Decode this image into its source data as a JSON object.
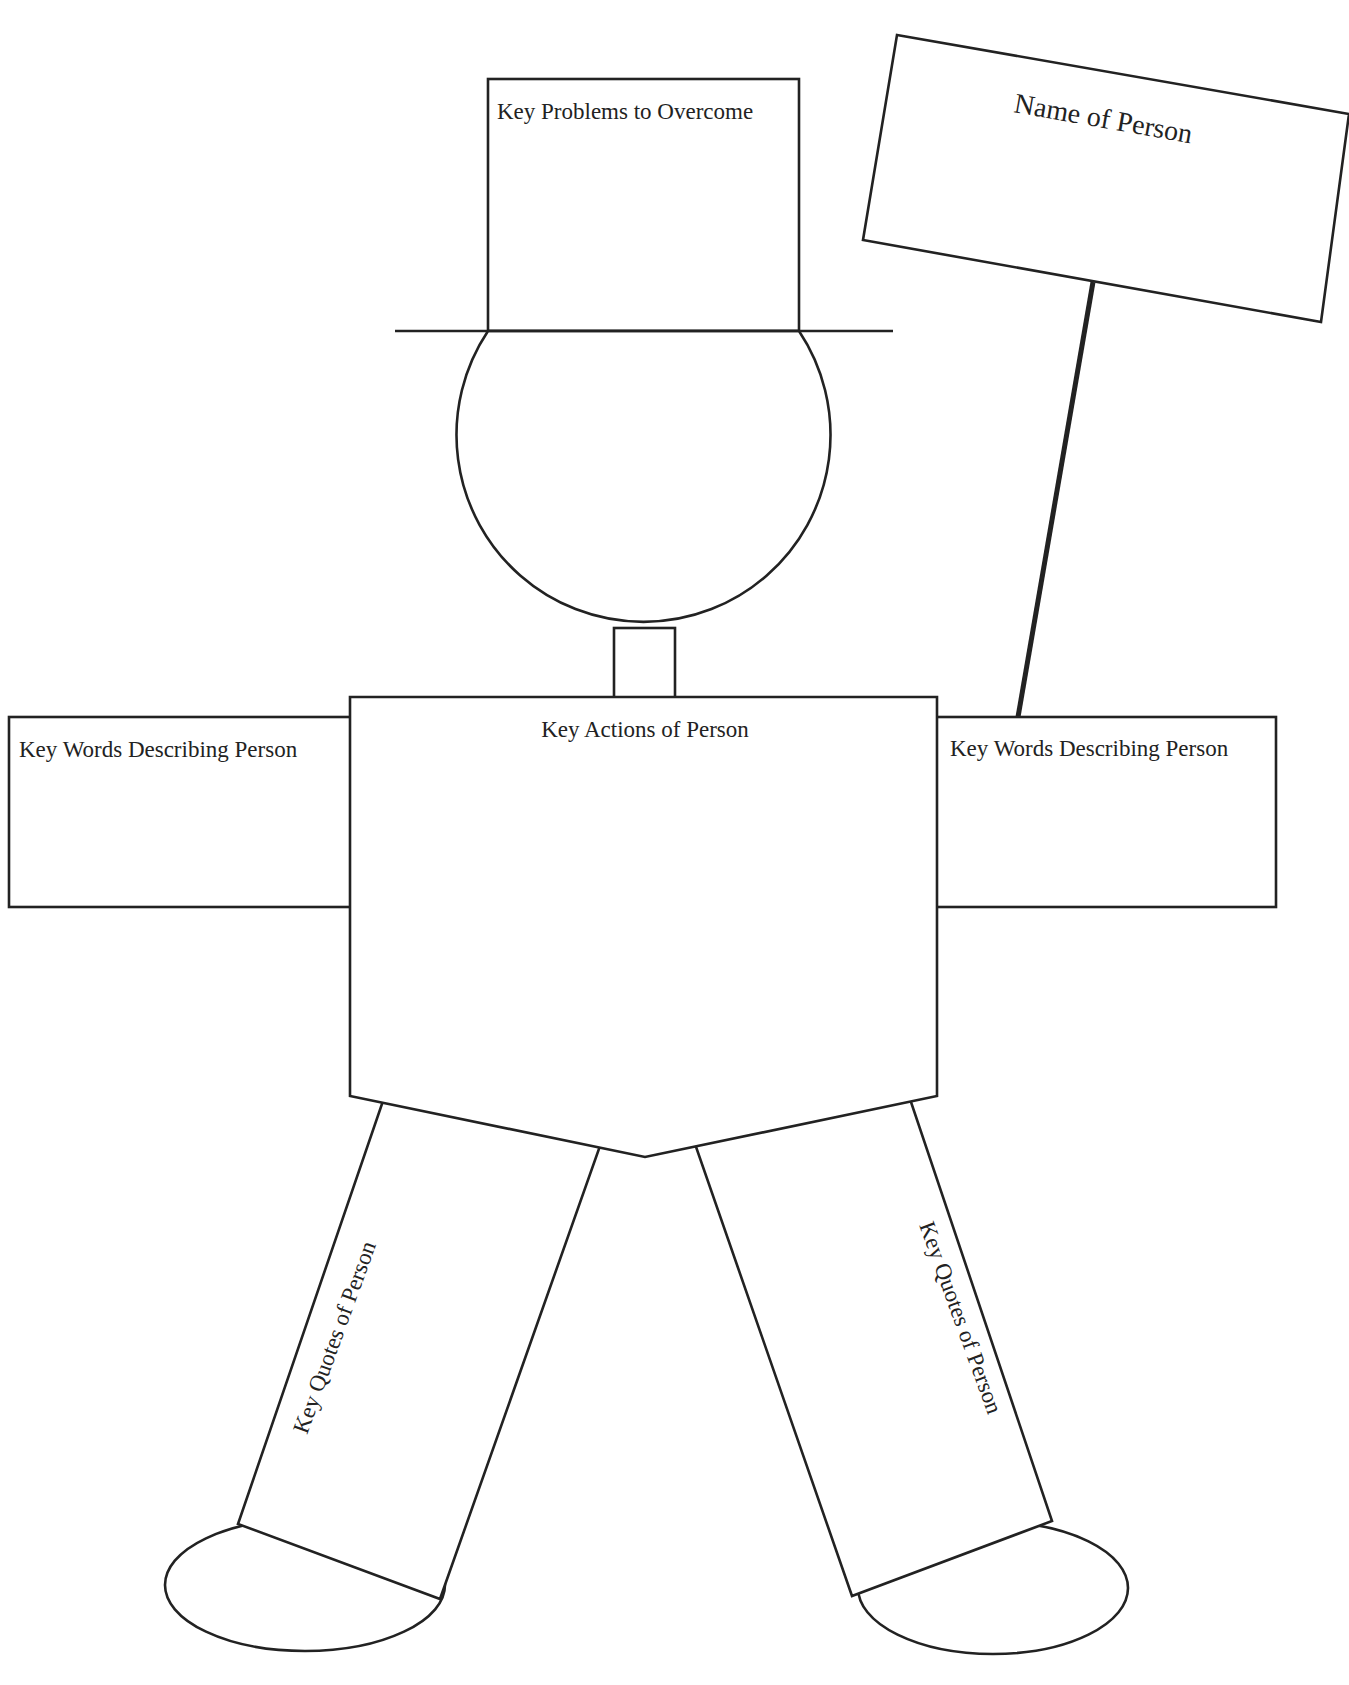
{
  "organizer": {
    "title": "Person Graphic Organizer",
    "hat": {
      "label": "Key Problems to Overcome"
    },
    "sign": {
      "label": "Name of Person"
    },
    "left_arm": {
      "label": "Key Words Describing Person"
    },
    "right_arm": {
      "label": "Key Words Describing Person"
    },
    "torso": {
      "label": "Key Actions of Person"
    },
    "left_leg": {
      "label": "Key Quotes of Person"
    },
    "right_leg": {
      "label": "Key Quotes of Person"
    }
  },
  "colors": {
    "stroke": "#222222",
    "background": "#ffffff",
    "text": "#222222"
  }
}
